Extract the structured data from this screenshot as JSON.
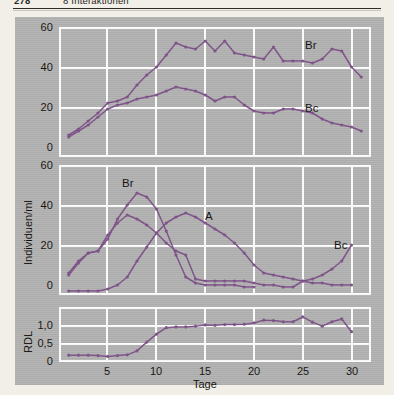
{
  "runhead": {
    "page_number": "278",
    "chapter": "8 Interaktionen"
  },
  "figure": {
    "x_axis_label": "Tage",
    "x_ticks": [
      "5",
      "10",
      "15",
      "20",
      "25",
      "30"
    ],
    "line_color": "#7e5289",
    "grid_color": "#ffffff",
    "plate_color": "#b2b2b2"
  },
  "chart_data": [
    {
      "type": "line",
      "panel": "top",
      "title": "",
      "xlabel": "",
      "ylabel": "",
      "xlim": [
        0,
        32
      ],
      "ylim": [
        0,
        65
      ],
      "yticks": [
        0,
        20,
        40,
        60
      ],
      "ytick_labels": [
        "0",
        "20",
        "40",
        "60"
      ],
      "xticks": [
        5,
        10,
        15,
        20,
        25,
        30
      ],
      "grid": true,
      "legend_position": "inline-annotation",
      "series": [
        {
          "name": "Br",
          "label": "Br",
          "x": [
            1,
            2,
            3,
            4,
            5,
            6,
            7,
            8,
            9,
            10,
            11,
            12,
            13,
            14,
            15,
            16,
            17,
            18,
            19,
            20,
            21,
            22,
            23,
            24,
            25,
            26,
            27,
            28,
            29,
            30,
            31
          ],
          "values": [
            11,
            14,
            18,
            22,
            27,
            28,
            30,
            36,
            41,
            45,
            51,
            57,
            55,
            54,
            58,
            53,
            58,
            52,
            51,
            50,
            49,
            55,
            48,
            48,
            48,
            47,
            49,
            54,
            53,
            45,
            40
          ]
        },
        {
          "name": "Bc",
          "label": "Bc",
          "x": [
            1,
            2,
            3,
            4,
            5,
            6,
            7,
            8,
            9,
            10,
            11,
            12,
            13,
            14,
            15,
            16,
            17,
            18,
            19,
            20,
            21,
            22,
            23,
            24,
            25,
            26,
            27,
            28,
            29,
            30,
            31
          ],
          "values": [
            10,
            13,
            16,
            20,
            24,
            26,
            27,
            29,
            30,
            31,
            33,
            35,
            34,
            33,
            31,
            28,
            30,
            30,
            26,
            23,
            22,
            22,
            24,
            24,
            23,
            22,
            19,
            17,
            16,
            15,
            13
          ]
        }
      ]
    },
    {
      "type": "line",
      "panel": "middle",
      "title": "",
      "xlabel": "",
      "ylabel": "Individuen/ml",
      "xlim": [
        0,
        32
      ],
      "ylim": [
        0,
        65
      ],
      "yticks": [
        0,
        20,
        40,
        60
      ],
      "ytick_labels": [
        "0",
        "20",
        "40",
        "60"
      ],
      "xticks": [
        5,
        10,
        15,
        20,
        25,
        30
      ],
      "grid": true,
      "legend_position": "inline-annotation",
      "series": [
        {
          "name": "Br",
          "label": "Br",
          "x": [
            1,
            2,
            3,
            4,
            5,
            6,
            7,
            8,
            9,
            10,
            11,
            12,
            13,
            14,
            15,
            16,
            17,
            18,
            19,
            20
          ],
          "values": [
            11,
            17,
            21,
            22,
            28,
            38,
            45,
            51,
            49,
            43,
            32,
            20,
            9,
            6,
            5,
            5,
            5,
            5,
            4,
            4
          ]
        },
        {
          "name": "A",
          "label": "A",
          "x": [
            1,
            2,
            3,
            4,
            5,
            6,
            7,
            8,
            9,
            10,
            11,
            12,
            13,
            14,
            15,
            16,
            17,
            18,
            19,
            20,
            21,
            22,
            23,
            24,
            25,
            26,
            27,
            28,
            29,
            30
          ],
          "values": [
            2,
            2,
            2,
            2,
            3,
            5,
            9,
            17,
            24,
            31,
            36,
            39,
            41,
            39,
            36,
            33,
            30,
            26,
            21,
            15,
            11,
            10,
            9,
            8,
            7,
            6,
            6,
            5,
            5,
            5
          ]
        },
        {
          "name": "Bc",
          "label": "Bc",
          "x": [
            1,
            2,
            3,
            4,
            5,
            6,
            7,
            8,
            9,
            10,
            11,
            12,
            13,
            14,
            15,
            16,
            17,
            18,
            19,
            20,
            21,
            22,
            23,
            24,
            25,
            26,
            27,
            28,
            29,
            30
          ],
          "values": [
            10,
            16,
            21,
            22,
            30,
            36,
            40,
            38,
            35,
            31,
            26,
            22,
            20,
            8,
            7,
            7,
            7,
            7,
            7,
            6,
            5,
            5,
            4,
            4,
            7,
            8,
            10,
            13,
            17,
            25
          ]
        }
      ]
    },
    {
      "type": "line",
      "panel": "bottom",
      "title": "",
      "xlabel": "Tage",
      "ylabel": "RDL",
      "xlim": [
        0,
        32
      ],
      "ylim": [
        -0.08,
        1.3
      ],
      "yticks": [
        0,
        0.5,
        1.0
      ],
      "ytick_labels": [
        "0",
        "0,5",
        "1,0"
      ],
      "xticks": [
        5,
        10,
        15,
        20,
        25,
        30
      ],
      "grid": true,
      "legend_position": "none",
      "series": [
        {
          "name": "RDL",
          "label": "",
          "x": [
            1,
            2,
            3,
            4,
            5,
            6,
            7,
            8,
            9,
            10,
            11,
            12,
            13,
            14,
            15,
            16,
            17,
            18,
            19,
            20,
            21,
            22,
            23,
            24,
            25,
            26,
            27,
            28,
            29,
            30
          ],
          "values": [
            0.09,
            0.09,
            0.09,
            0.08,
            0.06,
            0.08,
            0.1,
            0.2,
            0.42,
            0.62,
            0.78,
            0.8,
            0.8,
            0.82,
            0.85,
            0.84,
            0.86,
            0.86,
            0.87,
            0.9,
            0.97,
            0.96,
            0.93,
            0.93,
            1.05,
            0.92,
            0.82,
            0.93,
            1.0,
            0.68
          ]
        }
      ]
    }
  ],
  "annotations": {
    "top_br": "Br",
    "top_bc": "Bc",
    "mid_br": "Br",
    "mid_a": "A",
    "mid_bc": "Bc"
  }
}
